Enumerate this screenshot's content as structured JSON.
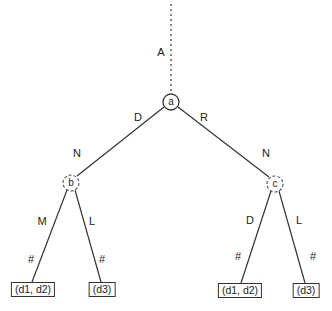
{
  "diagram": {
    "type": "tree",
    "root_edge": {
      "label": "A",
      "style": "dotted"
    },
    "nodes": {
      "a": {
        "label": "a",
        "style": "solid"
      },
      "b": {
        "label": "b",
        "style": "dashed"
      },
      "c": {
        "label": "c",
        "style": "dashed"
      }
    },
    "edges": {
      "a_b": {
        "label_top": "D",
        "label_bottom": "N"
      },
      "a_c": {
        "label_top": "R",
        "label_bottom": "N"
      },
      "b_leaf1": {
        "label_top": "M",
        "label_bottom": "#"
      },
      "b_leaf2": {
        "label_top": "L",
        "label_bottom": "#"
      },
      "c_leaf3": {
        "label_top": "D",
        "label_bottom": "#"
      },
      "c_leaf4": {
        "label_top": "L",
        "label_bottom": "#"
      }
    },
    "leaves": [
      {
        "label": "(d1, d2)"
      },
      {
        "label": "(d3)"
      },
      {
        "label": "(d1, d2)"
      },
      {
        "label": "(d3)"
      }
    ]
  }
}
